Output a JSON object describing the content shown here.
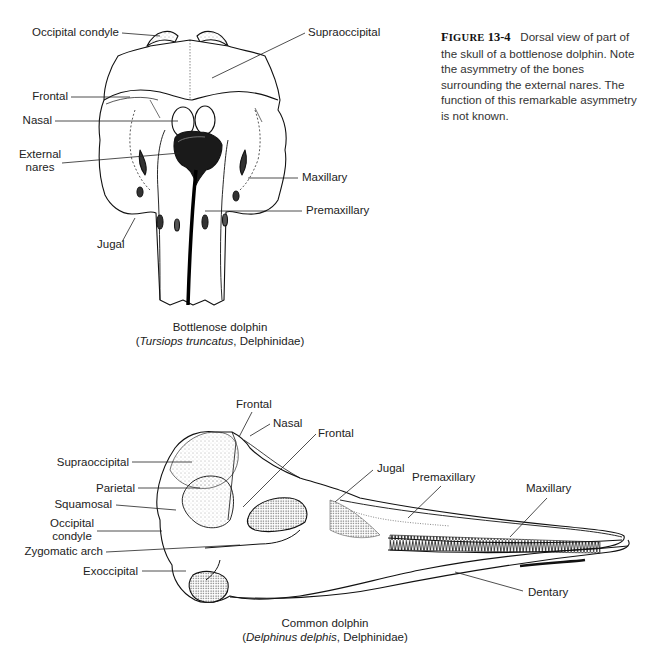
{
  "figure": {
    "number_prefix": "F",
    "number_prefix_small": "IGURE",
    "number": "13-4",
    "caption": "Dorsal view of part of the skull of a bottlenose dolphin. Note the asymmetry of the bones surrounding the external nares. The function of this remarkable asymmetry is not known."
  },
  "top_view": {
    "species_common": "Bottlenose dolphin",
    "species_open": "(",
    "species_latin": "Tursiops truncatus",
    "species_family": ", Delphinidae)",
    "labels": {
      "occipital_condyle": "Occipital condyle",
      "supraoccipital": "Supraoccipital",
      "frontal": "Frontal",
      "nasal": "Nasal",
      "external_nares_1": "External",
      "external_nares_2": "nares",
      "maxillary": "Maxillary",
      "premaxillary": "Premaxillary",
      "jugal": "Jugal"
    }
  },
  "side_view": {
    "species_common": "Common dolphin",
    "species_open": "(",
    "species_latin": "Delphinus delphis",
    "species_family": ", Delphinidae)",
    "labels": {
      "frontal_top": "Frontal",
      "nasal": "Nasal",
      "frontal": "Frontal",
      "supraoccipital": "Supraoccipital",
      "parietal": "Parietal",
      "squamosal": "Squamosal",
      "occipital_condyle_1": "Occipital",
      "occipital_condyle_2": "condyle",
      "zygomatic_arch": "Zygomatic arch",
      "exoccipital": "Exoccipital",
      "jugal": "Jugal",
      "premaxillary": "Premaxillary",
      "maxillary": "Maxillary",
      "dentary": "Dentary"
    }
  }
}
